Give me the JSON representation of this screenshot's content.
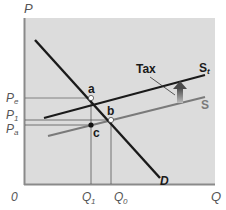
{
  "diagram": {
    "axes": {
      "y_label": "P",
      "x_label": "Q",
      "origin_label": "0"
    },
    "price_labels": {
      "pe": "P",
      "pe_sub": "e",
      "p1": "P",
      "p1_sub": "1",
      "pa": "P",
      "pa_sub": "a"
    },
    "quantity_labels": {
      "q1": "Q",
      "q1_sub": "1",
      "q0": "Q",
      "q0_sub": "0"
    },
    "curves": {
      "demand": "D",
      "supply": "S",
      "supply_tax": "S",
      "supply_tax_sub": "t"
    },
    "points": {
      "a": "a",
      "b": "b",
      "c": "c"
    },
    "annotation": {
      "tax": "Tax"
    },
    "colors": {
      "plot_background": "#dcdcdc",
      "axis": "#8a8a8a",
      "demand": "#1a1a1a",
      "supply": "#7a7a7a",
      "supply_tax": "#1a1a1a",
      "guides": "#555555",
      "arrow": "#6b6b6b"
    }
  }
}
